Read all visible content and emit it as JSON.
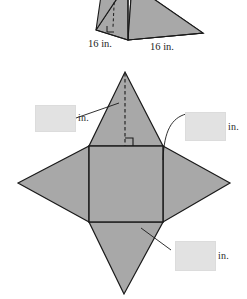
{
  "figure": {
    "kind": "geometry-net-diagram",
    "colors": {
      "fill": "#a8a8a8",
      "stroke": "#1a1a1a",
      "background": "#ffffff",
      "blank": "#e2e2e2"
    }
  },
  "solid": {
    "name": "square-pyramid-solid",
    "dimension_labels": [
      {
        "id": "base-left",
        "text": "16 in."
      },
      {
        "id": "base-right",
        "text": "16 in."
      }
    ]
  },
  "net": {
    "name": "pyramid-net",
    "answer_blanks": [
      {
        "id": "slant-height-blank",
        "value": "",
        "unit": "in."
      },
      {
        "id": "base-edge-blank",
        "value": "",
        "unit": "in."
      },
      {
        "id": "triangle-face-blank",
        "value": "",
        "unit": "in."
      }
    ],
    "markers": [
      {
        "id": "right-angle-marker",
        "type": "right-angle"
      },
      {
        "id": "altitude",
        "type": "dashed-line"
      }
    ]
  }
}
